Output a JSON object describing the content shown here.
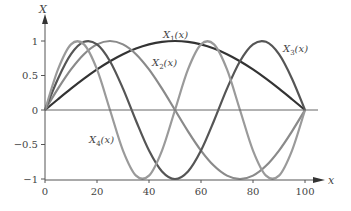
{
  "chart_data": {
    "type": "line",
    "title": "",
    "xlabel": "x",
    "ylabel": "X",
    "xlim": [
      0,
      100
    ],
    "ylim": [
      -1,
      1
    ],
    "x_ticks": [
      0,
      20,
      40,
      60,
      80,
      100
    ],
    "x_tick_labels": [
      "0",
      "20",
      "40",
      "60",
      "80",
      "100"
    ],
    "y_ticks": [
      1,
      0.5,
      0,
      -0.5,
      -1
    ],
    "y_tick_labels": [
      "1",
      "0.5",
      "0",
      "−0.5",
      "−1"
    ],
    "grid": false,
    "legend": "none",
    "x": [
      0,
      5,
      10,
      15,
      20,
      25,
      30,
      35,
      40,
      45,
      50,
      55,
      60,
      65,
      70,
      75,
      80,
      85,
      90,
      95,
      100
    ],
    "series": [
      {
        "name": "X1(x)",
        "label_main": "X",
        "label_sub": "1",
        "label_tail": "(x)",
        "color": "#333333",
        "values": [
          0,
          0.156,
          0.309,
          0.454,
          0.588,
          0.707,
          0.809,
          0.891,
          0.951,
          0.988,
          1,
          0.988,
          0.951,
          0.891,
          0.809,
          0.707,
          0.588,
          0.454,
          0.309,
          0.156,
          0
        ]
      },
      {
        "name": "X2(x)",
        "label_main": "X",
        "label_sub": "2",
        "label_tail": "(x)",
        "color": "#8a8a8a",
        "values": [
          0,
          0.309,
          0.588,
          0.809,
          0.951,
          1,
          0.951,
          0.809,
          0.588,
          0.309,
          0,
          -0.309,
          -0.588,
          -0.809,
          -0.951,
          -1,
          -0.951,
          -0.809,
          -0.588,
          -0.309,
          0
        ]
      },
      {
        "name": "X3(x)",
        "label_main": "X",
        "label_sub": "3",
        "label_tail": "(x)",
        "color": "#555555",
        "values": [
          0,
          0.454,
          0.809,
          0.988,
          0.951,
          0.707,
          0.309,
          -0.156,
          -0.588,
          -0.891,
          -1,
          -0.891,
          -0.588,
          -0.156,
          0.309,
          0.707,
          0.951,
          0.988,
          0.809,
          0.454,
          0
        ]
      },
      {
        "name": "X4(x)",
        "label_main": "X",
        "label_sub": "4",
        "label_tail": "(x)",
        "color": "#9a9a9a",
        "values": [
          0,
          0.588,
          0.951,
          0.951,
          0.588,
          0,
          -0.588,
          -0.951,
          -0.951,
          -0.588,
          0,
          0.588,
          0.951,
          0.951,
          0.588,
          0,
          -0.588,
          -0.951,
          -0.951,
          -0.588,
          0
        ]
      }
    ]
  }
}
